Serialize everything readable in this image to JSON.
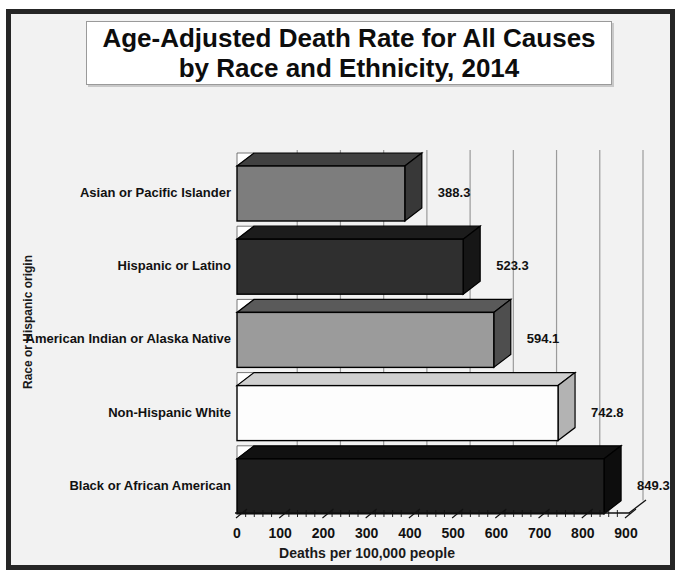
{
  "title": {
    "line1": "Age-Adjusted Death Rate for All Causes",
    "line2": "by Race and Ethnicity, 2014"
  },
  "chart_data": {
    "type": "bar",
    "orientation": "horizontal",
    "style": "3d",
    "title": "Age-Adjusted Death Rate for All Causes by Race and Ethnicity, 2014",
    "categories": [
      "Asian or Pacific Islander",
      "Hispanic or Latino",
      "American Indian or Alaska Native",
      "Non-Hispanic White",
      "Black or African American"
    ],
    "values": [
      388.3,
      523.3,
      594.1,
      742.8,
      849.3
    ],
    "value_labels": [
      "388.3",
      "523.3",
      "594.1",
      "742.8",
      "849.3"
    ],
    "bar_colors": [
      {
        "front": "#7d7d7d",
        "top": "#414141",
        "side": "#383838"
      },
      {
        "front": "#2f2f2f",
        "top": "#1c1c1c",
        "side": "#161616"
      },
      {
        "front": "#9b9b9b",
        "top": "#5a5a5a",
        "side": "#4e4e4e"
      },
      {
        "front": "#fdfdfd",
        "top": "#cfcfcf",
        "side": "#b3b3b3"
      },
      {
        "front": "#1f1f1f",
        "top": "#111111",
        "side": "#0d0d0d"
      }
    ],
    "xlabel": "Deaths per 100,000 people",
    "ylabel": "Race or Hispanic origin",
    "xlim": [
      0,
      900
    ],
    "x_ticks": [
      0,
      100,
      200,
      300,
      400,
      500,
      600,
      700,
      800,
      900
    ],
    "minor_tick_step": 20,
    "grid": true,
    "legend": false,
    "colors": {
      "background": "#f2f2f2",
      "gridline": "#9b9b9b",
      "axis": "#111111",
      "text": "#111111"
    }
  }
}
